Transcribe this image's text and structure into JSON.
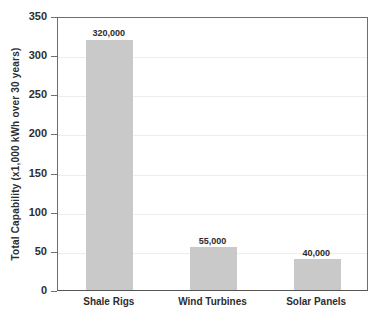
{
  "chart_data": {
    "type": "bar",
    "title": "",
    "subtitle": "",
    "xlabel": "",
    "ylabel": "Total Capability (x1,000 kWh over 30 years)",
    "categories": [
      "Shale Rigs",
      "Wind Turbines",
      "Solar Panels"
    ],
    "values": [
      320,
      55,
      40
    ],
    "value_labels": [
      "320,000",
      "55,000",
      "40,000"
    ],
    "ylim": [
      0,
      350
    ],
    "ytick_values": [
      0,
      50,
      100,
      150,
      200,
      250,
      300,
      350
    ],
    "ytick_labels": [
      "0",
      "50",
      "100",
      "150",
      "200",
      "250",
      "300",
      "350"
    ],
    "grid": "horizontal",
    "legend": "none",
    "bar_color": "#c9c9c9",
    "axis_color": "#6e6e6e",
    "grid_color": "#ededed",
    "text_color": "#2e2e2e",
    "background": "#ffffff",
    "unit_note": "values plotted in thousands; data labels show full kWh counts"
  }
}
